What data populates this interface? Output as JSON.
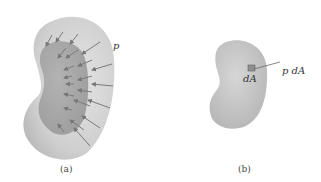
{
  "figure_a": {
    "pressure_label": "p",
    "caption": "(a)"
  },
  "figure_b": {
    "area_label": "dA",
    "force_label": "p dA",
    "caption": "(b)"
  },
  "colors": {
    "body_outer": "#c9c9c9",
    "body_inner": "#a9a9a9",
    "arrow": "#7a7a7a"
  }
}
